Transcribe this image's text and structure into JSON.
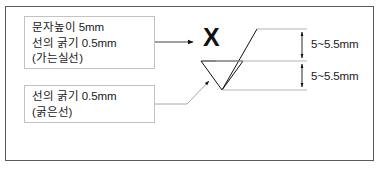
{
  "diagram": {
    "background_color": "#ffffff",
    "frame_color": "#5a5a5a",
    "line_color": "#1a1a1a",
    "extension_line_color": "#b5b5b5"
  },
  "callouts": [
    {
      "name": "thin-line-callout",
      "lines": [
        "문자높이 5mm",
        "선의 굵기 0.5mm",
        "(가는실선)"
      ]
    },
    {
      "name": "thick-line-callout",
      "lines": [
        "선의 굵기 0.5mm",
        "(굵은선)"
      ]
    }
  ],
  "symbol": {
    "letter": "X"
  },
  "dimensions": [
    {
      "name": "upper-dimension",
      "label": "5~5.5mm"
    },
    {
      "name": "lower-dimension",
      "label": "5~5.5mm"
    }
  ]
}
